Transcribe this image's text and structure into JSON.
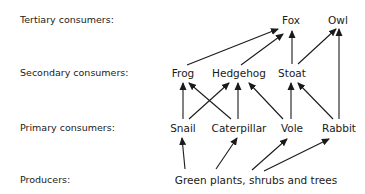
{
  "diagram": {
    "type": "food-web",
    "levels": [
      {
        "id": "tertiary",
        "label": "Tertiary consumers:",
        "y": 20
      },
      {
        "id": "secondary",
        "label": "Secondary consumers:",
        "y": 73
      },
      {
        "id": "primary",
        "label": "Primary consumers:",
        "y": 128
      },
      {
        "id": "producers",
        "label": "Producers:",
        "y": 180
      }
    ],
    "nodes": {
      "fox": {
        "label": "Fox",
        "x": 291,
        "y": 20
      },
      "owl": {
        "label": "Owl",
        "x": 338,
        "y": 20
      },
      "frog": {
        "label": "Frog",
        "x": 183,
        "y": 73
      },
      "hedgehog": {
        "label": "Hedgehog",
        "x": 239,
        "y": 73
      },
      "stoat": {
        "label": "Stoat",
        "x": 292,
        "y": 73
      },
      "snail": {
        "label": "Snail",
        "x": 183,
        "y": 128
      },
      "caterpillar": {
        "label": "Caterpillar",
        "x": 239,
        "y": 128
      },
      "vole": {
        "label": "Vole",
        "x": 292,
        "y": 128
      },
      "rabbit": {
        "label": "Rabbit",
        "x": 339,
        "y": 128
      },
      "plants": {
        "label": "Green plants, shrubs and trees",
        "x": 256,
        "y": 180
      }
    },
    "edges": [
      {
        "from": "frog",
        "to": "fox",
        "x1": 187,
        "y1": 65,
        "x2": 278,
        "y2": 29
      },
      {
        "from": "hedgehog",
        "to": "fox",
        "x1": 241,
        "y1": 65,
        "x2": 283,
        "y2": 34
      },
      {
        "from": "stoat",
        "to": "fox",
        "x1": 292,
        "y1": 64,
        "x2": 292,
        "y2": 31
      },
      {
        "from": "stoat",
        "to": "owl",
        "x1": 298,
        "y1": 64,
        "x2": 336,
        "y2": 29
      },
      {
        "from": "rabbit",
        "to": "owl",
        "x1": 339,
        "y1": 119,
        "x2": 339,
        "y2": 29
      },
      {
        "from": "snail",
        "to": "frog",
        "x1": 183,
        "y1": 119,
        "x2": 183,
        "y2": 83
      },
      {
        "from": "caterpillar",
        "to": "frog",
        "x1": 231,
        "y1": 119,
        "x2": 189,
        "y2": 83
      },
      {
        "from": "snail",
        "to": "hedgehog",
        "x1": 189,
        "y1": 119,
        "x2": 229,
        "y2": 83
      },
      {
        "from": "caterpillar",
        "to": "hedgehog",
        "x1": 238,
        "y1": 119,
        "x2": 238,
        "y2": 83
      },
      {
        "from": "vole",
        "to": "hedgehog",
        "x1": 283,
        "y1": 119,
        "x2": 249,
        "y2": 83
      },
      {
        "from": "vole",
        "to": "stoat",
        "x1": 291,
        "y1": 119,
        "x2": 291,
        "y2": 83
      },
      {
        "from": "rabbit",
        "to": "stoat",
        "x1": 333,
        "y1": 119,
        "x2": 298,
        "y2": 83
      },
      {
        "from": "plants",
        "to": "snail",
        "x1": 185,
        "y1": 169,
        "x2": 182,
        "y2": 138
      },
      {
        "from": "plants",
        "to": "caterpillar",
        "x1": 216,
        "y1": 169,
        "x2": 237,
        "y2": 138
      },
      {
        "from": "plants",
        "to": "vole",
        "x1": 252,
        "y1": 170,
        "x2": 287,
        "y2": 139
      },
      {
        "from": "plants",
        "to": "rabbit",
        "x1": 264,
        "y1": 171,
        "x2": 329,
        "y2": 139
      }
    ],
    "colors": {
      "line": "#1a1a1a",
      "text": "#1a1a1a",
      "background": "#ffffff"
    }
  }
}
